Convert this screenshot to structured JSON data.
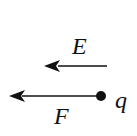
{
  "diagram": {
    "type": "physics-force-diagram",
    "field_arrow": {
      "label": "E",
      "direction": "left"
    },
    "force_arrow": {
      "label": "F",
      "direction": "left"
    },
    "charge": {
      "label": "q"
    },
    "colors": {
      "ink": "#111111",
      "background": "#ffffff"
    }
  }
}
